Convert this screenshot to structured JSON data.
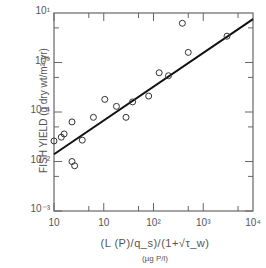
{
  "chart_data": {
    "type": "scatter",
    "title": "",
    "xlabel": "(L (P)/q_s)/(1+√τ_w)",
    "xlabel_units": "(µg P/l)",
    "ylabel": "FISH YIELD (g dry wt/m²·yr)",
    "xscale": "log",
    "yscale": "log",
    "x_tick_labels": [
      "10",
      "10",
      "10²",
      "10³",
      "10⁴"
    ],
    "x_tick_values": [
      1,
      10,
      100,
      1000,
      10000
    ],
    "y_tick_labels": [
      "10⁻³",
      "10⁻²",
      "10⁻¹",
      "10⁰",
      "10¹"
    ],
    "y_tick_values": [
      0.001,
      0.01,
      0.1,
      1,
      10
    ],
    "xlim": [
      1,
      10000
    ],
    "ylim": [
      0.001,
      10
    ],
    "grid": false,
    "points": [
      {
        "x": 1.0,
        "y": 0.026
      },
      {
        "x": 1.4,
        "y": 0.031
      },
      {
        "x": 1.6,
        "y": 0.036
      },
      {
        "x": 2.3,
        "y": 0.063
      },
      {
        "x": 2.3,
        "y": 0.01
      },
      {
        "x": 2.6,
        "y": 0.0082
      },
      {
        "x": 3.7,
        "y": 0.027
      },
      {
        "x": 6.2,
        "y": 0.078
      },
      {
        "x": 10.5,
        "y": 0.18
      },
      {
        "x": 18,
        "y": 0.13
      },
      {
        "x": 28,
        "y": 0.078
      },
      {
        "x": 38,
        "y": 0.16
      },
      {
        "x": 80,
        "y": 0.21
      },
      {
        "x": 130,
        "y": 0.62
      },
      {
        "x": 200,
        "y": 0.54
      },
      {
        "x": 380,
        "y": 6.2
      },
      {
        "x": 500,
        "y": 1.6
      },
      {
        "x": 3000,
        "y": 3.4
      }
    ],
    "fit_line": {
      "x": [
        1,
        10000
      ],
      "y": [
        0.014,
        7.5
      ]
    }
  }
}
